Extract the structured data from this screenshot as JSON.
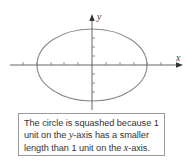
{
  "figure": {
    "axes": {
      "x_label": "x",
      "y_label": "y"
    },
    "shape": "ellipse",
    "colors": {
      "axis": "#555555",
      "ellipse": "#8a8a8a",
      "caption_border": "#9a9a9a",
      "caption_text": "#333333"
    }
  },
  "caption": {
    "line1": "The circle is squashed because 1",
    "line2_pre": "unit on the ",
    "line2_var": "y",
    "line2_post": "-axis has a smaller",
    "line3_pre": "length than 1 unit on the ",
    "line3_var": "x",
    "line3_post": "-axis."
  }
}
